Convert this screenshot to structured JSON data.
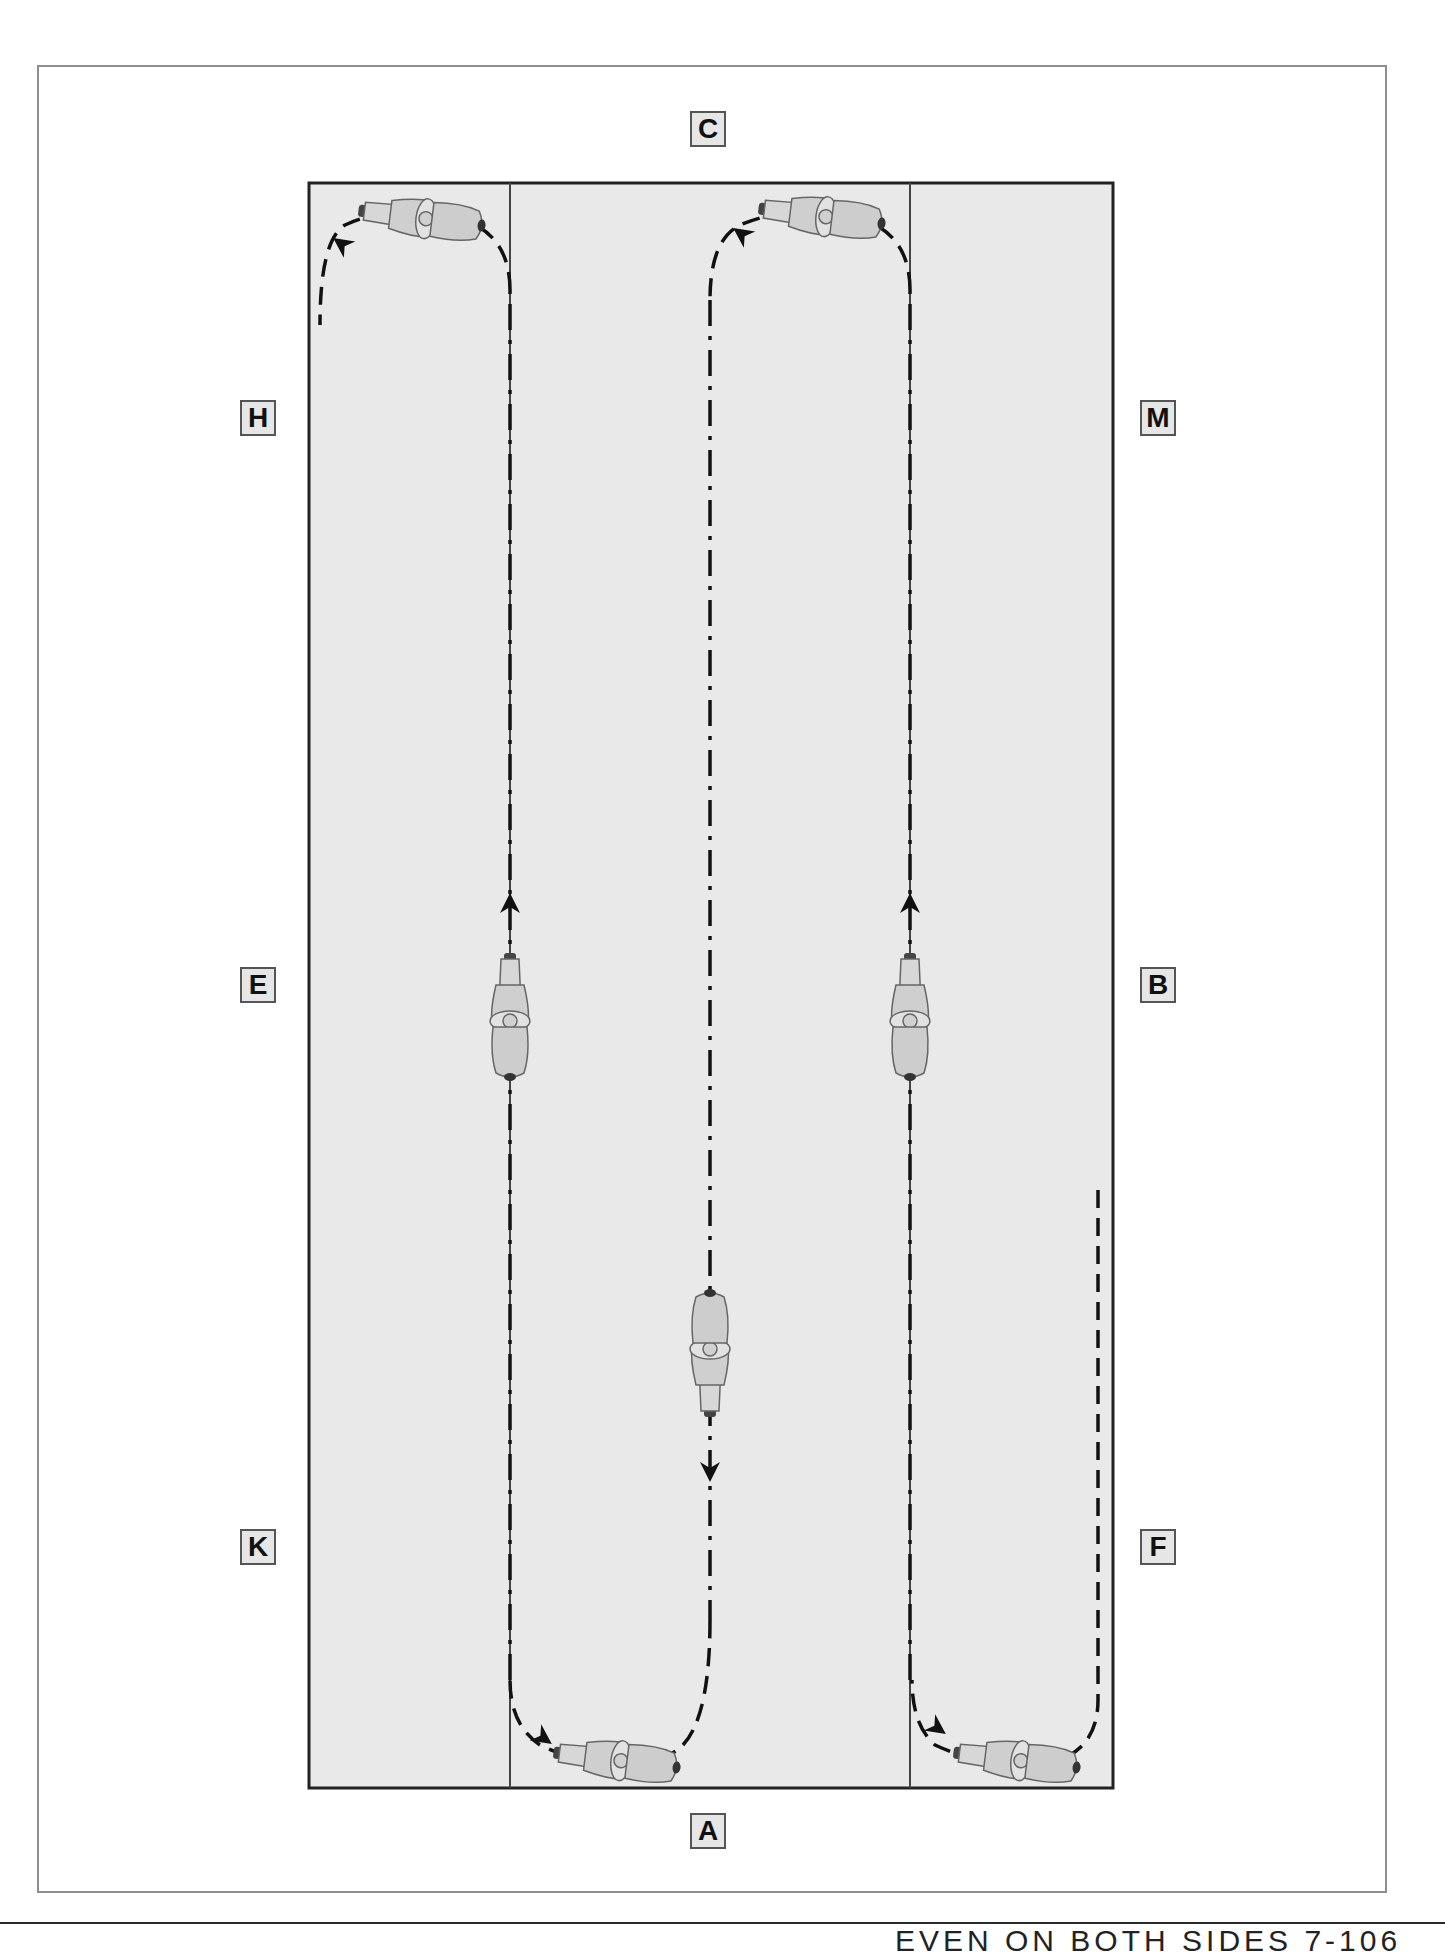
{
  "diagram": {
    "arena_fill": "#e9e9e9",
    "arena_border": "#222222",
    "page_border": "#8e8e8e",
    "letters": {
      "top": "C",
      "bottom": "A",
      "left_upper": "H",
      "left_middle": "E",
      "left_lower": "K",
      "right_upper": "M",
      "right_middle": "B",
      "right_lower": "F"
    },
    "path": {
      "style": "dash-dot line with direction arrows",
      "description": "Rider enters up the right track from F, turns at A end toward the right third line, rides up past B, loops at C end, rides down the centre line, loops at A end, rides up the left third line past E, and loops at C end toward H."
    },
    "riders": [
      {
        "label": "rider-top-left",
        "heading": "left"
      },
      {
        "label": "rider-top-center",
        "heading": "left"
      },
      {
        "label": "rider-left-line-E",
        "heading": "up"
      },
      {
        "label": "rider-right-line-B",
        "heading": "up"
      },
      {
        "label": "rider-center-line",
        "heading": "down"
      },
      {
        "label": "rider-bottom-left",
        "heading": "left"
      },
      {
        "label": "rider-bottom-right",
        "heading": "left"
      }
    ]
  },
  "footer": {
    "text": "EVEN ON BOTH SIDES 7-106"
  }
}
